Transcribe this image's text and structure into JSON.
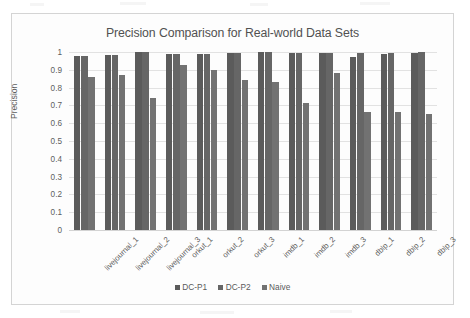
{
  "chart_data": {
    "type": "bar",
    "title": "Precision Comparison for Real-world Data Sets",
    "xlabel": "",
    "ylabel": "Precision",
    "ylim": [
      0,
      1
    ],
    "ytick_labels": [
      "1",
      "0.9",
      "0.8",
      "0.7",
      "0.6",
      "0.5",
      "0.4",
      "0.3",
      "0.2",
      "0.1",
      "0"
    ],
    "ytick_values": [
      1,
      0.9,
      0.8,
      0.7,
      0.6,
      0.5,
      0.4,
      0.3,
      0.2,
      0.1,
      0
    ],
    "grid": true,
    "legend_position": "bottom",
    "categories": [
      "livejournal_1",
      "livejournal_2",
      "livejournal_3",
      "orkut_1",
      "orkut_2",
      "orkut_3",
      "imdb_1",
      "imdb_2",
      "imdb_3",
      "dblp_1",
      "dblp_2",
      "dblp_3"
    ],
    "series": [
      {
        "name": "DC-P1",
        "color": "#5b5b5b",
        "values": [
          0.98,
          0.985,
          1.0,
          0.99,
          0.99,
          0.995,
          1.0,
          0.995,
          0.995,
          0.97,
          0.99,
          0.995
        ]
      },
      {
        "name": "DC-P2",
        "color": "#666666",
        "values": [
          0.98,
          0.985,
          1.0,
          0.99,
          0.99,
          0.995,
          1.0,
          0.995,
          0.995,
          0.995,
          0.995,
          1.0
        ]
      },
      {
        "name": "Naive",
        "color": "#727272",
        "values": [
          0.86,
          0.87,
          0.74,
          0.925,
          0.9,
          0.845,
          0.83,
          0.715,
          0.88,
          0.665,
          0.665,
          0.65
        ]
      }
    ]
  }
}
